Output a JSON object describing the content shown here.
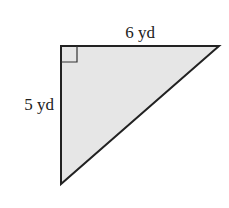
{
  "figure": {
    "shape": "right-triangle",
    "fill_color": "#e6e6e6",
    "stroke_color": "#222222",
    "labels": {
      "top_side": "6 yd",
      "left_side": "5 yd"
    },
    "right_angle_marker": true
  }
}
